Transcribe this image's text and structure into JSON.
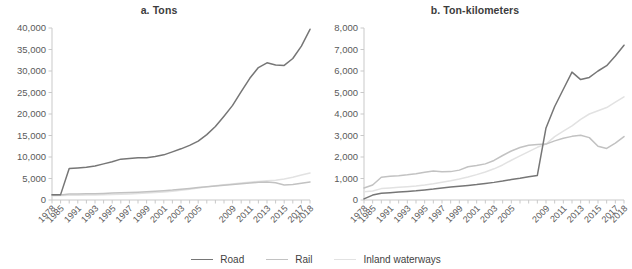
{
  "figure": {
    "background": "#ffffff",
    "panels": [
      {
        "key": "a",
        "title": "a. Tons"
      },
      {
        "key": "b",
        "title": "b. Ton-kilometers"
      }
    ]
  },
  "legend": {
    "position": "bottom-center",
    "items": [
      {
        "label": "Road",
        "color": "#767676"
      },
      {
        "label": "Rail",
        "color": "#c2c2c2"
      },
      {
        "label": "Inland waterways",
        "color": "#e2e2e2"
      }
    ]
  },
  "chart_data": [
    {
      "type": "line",
      "title": "a. Tons",
      "xlabel": "",
      "ylabel": "",
      "grid": false,
      "legend": "bottom-center",
      "ylim": [
        0,
        40000
      ],
      "yticks": [
        "0",
        "5,000",
        "10,000",
        "15,000",
        "20,000",
        "25,000",
        "30,000",
        "35,000",
        "40,000"
      ],
      "ytick_values": [
        0,
        5000,
        10000,
        15000,
        20000,
        25000,
        30000,
        35000,
        40000
      ],
      "x": [
        1978,
        1985,
        1990,
        1991,
        1992,
        1993,
        1994,
        1995,
        1996,
        1997,
        1998,
        1999,
        2000,
        2001,
        2002,
        2003,
        2004,
        2005,
        2006,
        2007,
        2008,
        2009,
        2010,
        2011,
        2012,
        2013,
        2014,
        2015,
        2016,
        2017,
        2018
      ],
      "xtick_labels": [
        "1978",
        "1985",
        "1991",
        "1993",
        "1995",
        "1997",
        "1999",
        "2001",
        "2003",
        "2005",
        "2009",
        "2011",
        "2013",
        "2015",
        "2017",
        "2018"
      ],
      "xtick_label_years": [
        1978,
        1985,
        1991,
        1993,
        1995,
        1997,
        1999,
        2001,
        2003,
        2005,
        2009,
        2011,
        2013,
        2015,
        2017,
        2018
      ],
      "series": [
        {
          "name": "Road",
          "color": "#767676",
          "values": [
            1200,
            1250,
            7300,
            7450,
            7600,
            7900,
            8400,
            8900,
            9500,
            9650,
            9800,
            9850,
            10100,
            10500,
            11200,
            11900,
            12700,
            13700,
            15200,
            17100,
            19500,
            22000,
            25200,
            28300,
            30800,
            31900,
            31400,
            31300,
            32900,
            35800,
            39700
          ]
        },
        {
          "name": "Rail",
          "color": "#c2c2c2",
          "values": [
            1100,
            1150,
            1380,
            1420,
            1450,
            1480,
            1520,
            1600,
            1680,
            1750,
            1820,
            1920,
            2030,
            2180,
            2300,
            2480,
            2680,
            2900,
            3080,
            3250,
            3450,
            3600,
            3780,
            3950,
            4100,
            4200,
            4000,
            3500,
            3600,
            3900,
            4200
          ]
        },
        {
          "name": "Inland waterways",
          "color": "#e2e2e2",
          "values": [
            1000,
            1050,
            1100,
            1120,
            1150,
            1180,
            1220,
            1280,
            1350,
            1420,
            1500,
            1600,
            1720,
            1880,
            2050,
            2280,
            2520,
            2800,
            3050,
            3300,
            3550,
            3750,
            3950,
            4150,
            4320,
            4480,
            4600,
            4900,
            5300,
            5800,
            6300
          ]
        }
      ]
    },
    {
      "type": "line",
      "title": "b. Ton-kilometers",
      "xlabel": "",
      "ylabel": "",
      "grid": false,
      "legend": "bottom-center",
      "ylim": [
        0,
        8000
      ],
      "yticks": [
        "0",
        "1,000",
        "2,000",
        "3,000",
        "4,000",
        "5,000",
        "6,000",
        "7,000",
        "8,000"
      ],
      "ytick_values": [
        0,
        1000,
        2000,
        3000,
        4000,
        5000,
        6000,
        7000,
        8000
      ],
      "x": [
        1978,
        1985,
        1990,
        1991,
        1992,
        1993,
        1994,
        1995,
        1996,
        1997,
        1998,
        1999,
        2000,
        2001,
        2002,
        2003,
        2004,
        2005,
        2006,
        2007,
        2008,
        2009,
        2010,
        2011,
        2012,
        2013,
        2014,
        2015,
        2016,
        2017,
        2018
      ],
      "xtick_labels": [
        "1978",
        "1985",
        "1991",
        "1993",
        "1995",
        "1997",
        "1999",
        "2001",
        "2003",
        "2005",
        "2009",
        "2011",
        "2013",
        "2015",
        "2017",
        "2018"
      ],
      "xtick_label_years": [
        1978,
        1985,
        1991,
        1993,
        1995,
        1997,
        1999,
        2001,
        2003,
        2005,
        2009,
        2011,
        2013,
        2015,
        2017,
        2018
      ],
      "series": [
        {
          "name": "Road",
          "color": "#767676",
          "values": [
            50,
            230,
            310,
            340,
            370,
            400,
            430,
            470,
            510,
            560,
            600,
            640,
            680,
            720,
            770,
            820,
            880,
            950,
            1010,
            1080,
            1140,
            3350,
            4350,
            5150,
            5950,
            5600,
            5700,
            6000,
            6250,
            6700,
            7200
          ]
        },
        {
          "name": "Rail",
          "color": "#c2c2c2",
          "values": [
            560,
            700,
            1060,
            1100,
            1130,
            1170,
            1220,
            1290,
            1350,
            1310,
            1320,
            1390,
            1550,
            1600,
            1680,
            1840,
            2070,
            2280,
            2440,
            2550,
            2580,
            2600,
            2750,
            2870,
            2960,
            3010,
            2900,
            2500,
            2400,
            2650,
            2950
          ]
        },
        {
          "name": "Inland waterways",
          "color": "#e2e2e2",
          "values": [
            380,
            420,
            530,
            560,
            590,
            620,
            650,
            700,
            760,
            830,
            900,
            980,
            1070,
            1180,
            1300,
            1450,
            1630,
            1850,
            2050,
            2250,
            2450,
            2600,
            2950,
            3200,
            3450,
            3750,
            4000,
            4150,
            4300,
            4550,
            4800
          ]
        }
      ]
    }
  ]
}
